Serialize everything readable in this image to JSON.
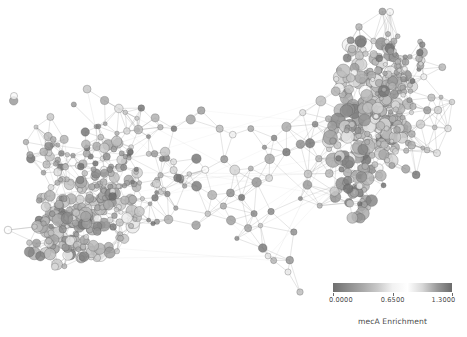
{
  "figure": {
    "background_color": "#ffffff",
    "width": 467,
    "height": 337
  },
  "colorbar": {
    "title": "mecA Enrichment",
    "orientation": "horizontal",
    "vmin": 0.0,
    "vmax": 1.3,
    "tick_labels": [
      "0.0000",
      "0.6500",
      "1.3000"
    ],
    "tick_values": [
      0.0,
      0.65,
      1.3
    ],
    "tick_positions_pct": [
      0,
      50,
      100
    ],
    "gradient_stops": [
      "#6f6f6f",
      "#8d8d8d",
      "#a9a9a9",
      "#c9c9c9",
      "#f2f2f2",
      "#ffffff",
      "#d8d8d8",
      "#9a9a9a",
      "#6b6b6b"
    ],
    "colormap_name": "grayscale-jet"
  },
  "chart_data": {
    "type": "scatter",
    "title": "",
    "xlabel": "",
    "ylabel": "",
    "grid": false,
    "legend_position": "bottom-right",
    "node_count": 620,
    "edge_count": 2100,
    "clusters": [
      {
        "name": "left-community",
        "cx": 95,
        "cy": 200,
        "rx": 72,
        "ry": 62,
        "nodes": 250
      },
      {
        "name": "right-community",
        "cx": 375,
        "cy": 120,
        "rx": 58,
        "ry": 105,
        "nodes": 270
      },
      {
        "name": "bridge",
        "cx": 235,
        "cy": 185,
        "rx": 80,
        "ry": 55,
        "nodes": 100
      }
    ],
    "value_range": [
      0.0,
      1.3
    ]
  }
}
